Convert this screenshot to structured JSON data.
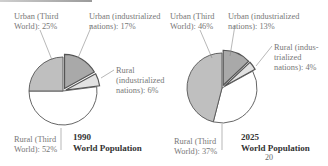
{
  "chart_data": [
    {
      "type": "pie",
      "title": "1990 World Population",
      "year": "1990",
      "subtitle": "World Population",
      "slices": [
        {
          "label": "Urban (industrialized nations)",
          "value": 17,
          "exploded": true,
          "color": "#a9a9a9"
        },
        {
          "label": "Rural (industrialized nations)",
          "value": 6,
          "exploded": true,
          "color": "#e2e2e2"
        },
        {
          "label": "Rural (Third World)",
          "value": 52,
          "exploded": false,
          "color": "#ffffff"
        },
        {
          "label": "Urban (Third World)",
          "value": 25,
          "exploded": false,
          "color": "#bfbfbf"
        }
      ]
    },
    {
      "type": "pie",
      "title": "2025 World Population",
      "year": "2025",
      "subtitle": "World Population",
      "slices": [
        {
          "label": "Urban (industrialized nations)",
          "value": 13,
          "exploded": true,
          "color": "#a9a9a9"
        },
        {
          "label": "Rural (industrialized nations)",
          "value": 4,
          "exploded": true,
          "color": "#e2e2e2"
        },
        {
          "label": "Rural (Third World)",
          "value": 37,
          "exploded": false,
          "color": "#ffffff"
        },
        {
          "label": "Urban (Third World)",
          "value": 46,
          "exploded": false,
          "color": "#bfbfbf"
        }
      ]
    }
  ],
  "labels": {
    "p1": {
      "urban_third_1": "Urban (Third",
      "urban_third_2": "World): 25%",
      "urban_ind_1": "Urban (industrialized",
      "urban_ind_2": "nations): 17%",
      "rural_ind_1": "Rural",
      "rural_ind_2": "(industrialized",
      "rural_ind_3": "nations): 6%",
      "rural_third_1": "Rural (Third",
      "rural_third_2": "World): 52%",
      "year": "1990",
      "subtitle": "World Population"
    },
    "p2": {
      "urban_third_1": "Urban (Third",
      "urban_third_2": "World): 46%",
      "urban_ind_1": "Urban (industrialized",
      "urban_ind_2": "nations): 13%",
      "rural_ind_1": "Rural (indus-",
      "rural_ind_2": "trialized",
      "rural_ind_3": "nations): 4%",
      "rural_third_1": "Rural (Third",
      "rural_third_2": "World): 37%",
      "year": "2025",
      "subtitle": "World Population"
    },
    "page_number": "20"
  }
}
